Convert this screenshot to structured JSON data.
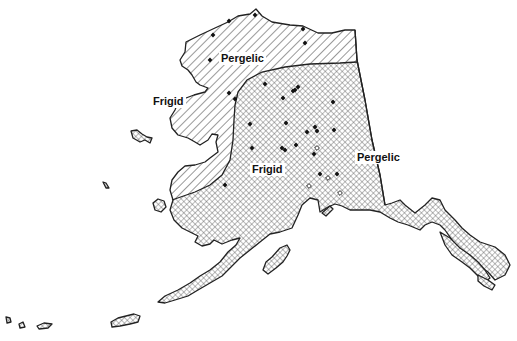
{
  "map": {
    "subject": "Alaska soil temperature regimes",
    "colors": {
      "outline": "#222222",
      "background": "#ffffff",
      "pattern_ink": "#333333"
    },
    "legend_patterns": {
      "pergelic": "diagonal-hatch",
      "frigid": "cross-hatch"
    },
    "labels": [
      {
        "id": "north-pergelic",
        "text": "Pergelic",
        "x": 219,
        "y": 52
      },
      {
        "id": "west-frigid",
        "text": "Frigid",
        "x": 151,
        "y": 95
      },
      {
        "id": "interior-frigid",
        "text": "Frigid",
        "x": 250,
        "y": 163
      },
      {
        "id": "east-pergelic",
        "text": "Pergelic",
        "x": 355,
        "y": 151
      }
    ],
    "stations_filled": [
      [
        255,
        15
      ],
      [
        229,
        21
      ],
      [
        213,
        35
      ],
      [
        303,
        29
      ],
      [
        305,
        43
      ],
      [
        210,
        60
      ],
      [
        252,
        148
      ],
      [
        282,
        148
      ],
      [
        285,
        150
      ],
      [
        296,
        145
      ],
      [
        295,
        90
      ],
      [
        298,
        87
      ],
      [
        229,
        93
      ],
      [
        235,
        99
      ],
      [
        265,
        84
      ],
      [
        283,
        98
      ],
      [
        293,
        91
      ],
      [
        286,
        123
      ],
      [
        315,
        127
      ],
      [
        317,
        131
      ],
      [
        333,
        102
      ],
      [
        334,
        130
      ],
      [
        307,
        132
      ],
      [
        250,
        124
      ],
      [
        314,
        154
      ],
      [
        320,
        174
      ],
      [
        225,
        185
      ],
      [
        337,
        174
      ]
    ],
    "stations_open": [
      [
        317,
        148
      ],
      [
        309,
        186
      ],
      [
        328,
        178
      ],
      [
        340,
        193
      ]
    ]
  }
}
